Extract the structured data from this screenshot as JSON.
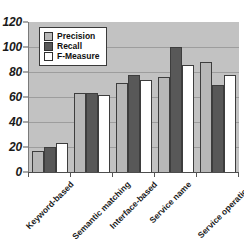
{
  "chart_data": {
    "type": "bar",
    "title": "",
    "subtitle": "",
    "xlabel": "",
    "ylabel": "",
    "ylim": [
      0,
      120
    ],
    "ytick_labels": [
      "0",
      "20",
      "40",
      "60",
      "80",
      "100",
      "120"
    ],
    "ytick_values": [
      0,
      20,
      40,
      60,
      80,
      100,
      120
    ],
    "grid": true,
    "legend_position": "top-left inside plot area",
    "categories": [
      "Keyword-based",
      "Semantic matching",
      "Interface-based",
      "Service name",
      "Service operations"
    ],
    "series": [
      {
        "name": "Precision",
        "color": "#b7b7b7",
        "values": [
          17,
          63,
          71,
          76,
          88
        ]
      },
      {
        "name": "Recall",
        "color": "#585858",
        "values": [
          20,
          63,
          78,
          100,
          70
        ]
      },
      {
        "name": "F-Measure",
        "color": "#ffffff",
        "values": [
          23,
          62,
          74,
          86,
          78
        ]
      }
    ],
    "colors": {
      "plot_background": "#c2c2c2",
      "gridline": "#9d9d9d",
      "axis": "#4d4d4d",
      "text": "#1a1a1a",
      "page_background": "#ffffff"
    }
  }
}
